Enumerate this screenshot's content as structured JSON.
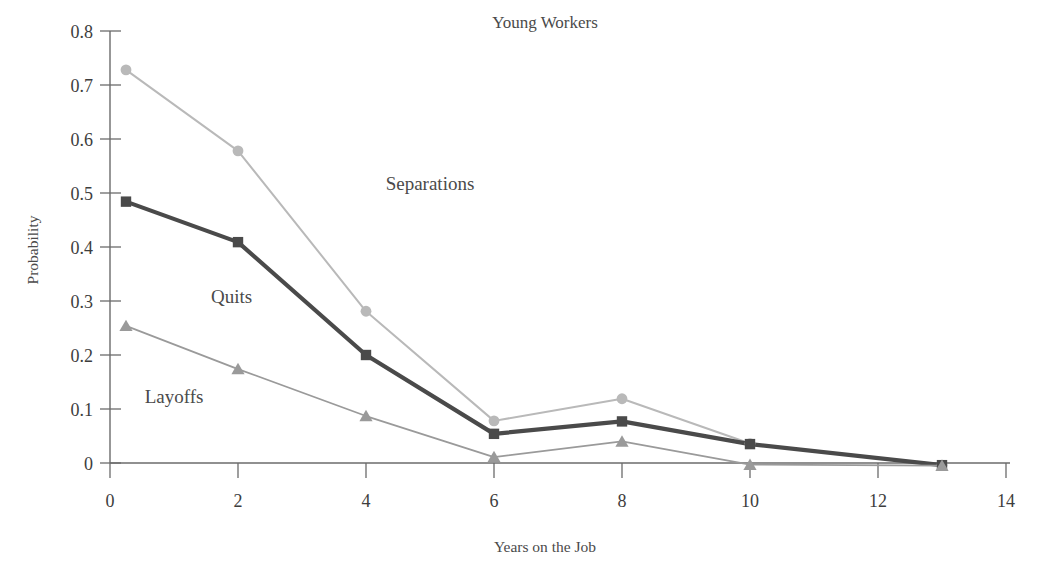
{
  "chart_data": {
    "type": "line",
    "title": "Young Workers",
    "xlabel": "Years on the Job",
    "ylabel": "Probability",
    "xlim": [
      0,
      14
    ],
    "ylim": [
      0,
      0.8
    ],
    "xticks": [
      "0",
      "2",
      "4",
      "6",
      "8",
      "10",
      "12",
      "14"
    ],
    "xtick_values": [
      0,
      2,
      4,
      6,
      8,
      10,
      12,
      14
    ],
    "yticks": [
      "0",
      "0.1",
      "0.2",
      "0.3",
      "0.4",
      "0.5",
      "0.6",
      "0.7",
      "0.8"
    ],
    "ytick_values": [
      0,
      0.1,
      0.2,
      0.3,
      0.4,
      0.5,
      0.6,
      0.7,
      0.8
    ],
    "grid": false,
    "legend_position": "inline-annotations",
    "x": [
      0.25,
      2,
      4,
      6,
      8,
      10,
      13
    ],
    "series": [
      {
        "name": "Separations",
        "color": "#b9b9b9",
        "marker": "circle",
        "line_width": 2.0,
        "values": [
          0.728,
          0.578,
          0.281,
          0.078,
          0.119,
          0.036,
          -0.004
        ],
        "label_x": 5.0,
        "label_y": 0.505
      },
      {
        "name": "Quits",
        "color": "#4a4a4a",
        "marker": "square",
        "line_width": 4.2,
        "values": [
          0.484,
          0.409,
          0.2,
          0.054,
          0.077,
          0.035,
          -0.004
        ],
        "label_x": 1.9,
        "label_y": 0.297
      },
      {
        "name": "Layoffs",
        "color": "#9a9a9a",
        "marker": "triangle",
        "line_width": 1.8,
        "values": [
          0.254,
          0.174,
          0.087,
          0.011,
          0.04,
          -0.003,
          -0.005
        ],
        "label_x": 1.0,
        "label_y": 0.112
      }
    ]
  },
  "plot_geometry": {
    "x_origin_px": 110,
    "x_unit_px": 64.0,
    "y_zero_px": 463,
    "y_unit_px": 540
  },
  "colors": {
    "separations": "#b9b9b9",
    "quits": "#4a4a4a",
    "layoffs": "#9a9a9a",
    "axis": "#6b6b6b",
    "text": "#3d3d3d",
    "background": "#ffffff"
  }
}
